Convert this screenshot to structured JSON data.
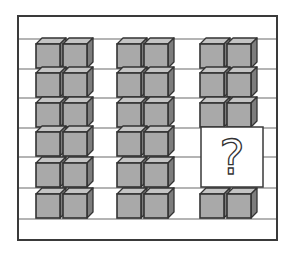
{
  "puzzle": {
    "title": "",
    "frame": {
      "x": 18,
      "y": 16,
      "width": 259,
      "height": 224
    },
    "row_lines_y": [
      39,
      69,
      98,
      128,
      157,
      188,
      219
    ],
    "cube_row_bottoms": [
      69,
      98,
      128,
      157,
      188,
      219
    ],
    "groups": [
      {
        "name": "group-1",
        "x": 36,
        "rows": [
          2,
          2,
          2,
          2,
          2,
          2
        ]
      },
      {
        "name": "group-2",
        "x": 117,
        "rows": [
          2,
          2,
          2,
          2,
          2,
          2
        ]
      },
      {
        "name": "group-3",
        "x": 200,
        "rows": [
          2,
          2,
          2,
          "?",
          "?",
          2
        ]
      }
    ],
    "question_box": {
      "x": 201,
      "y": 127,
      "width": 62,
      "height": 60,
      "glyph": "?"
    },
    "colors": {
      "frame": "#3a3a3a",
      "line": "#6a6a6a",
      "cube_front": "#a9a9a9",
      "cube_top": "#c4c4c4",
      "cube_side": "#7d7d7d",
      "cube_edge": "#333333",
      "background": "#ffffff"
    },
    "question_mark_label": "?"
  }
}
